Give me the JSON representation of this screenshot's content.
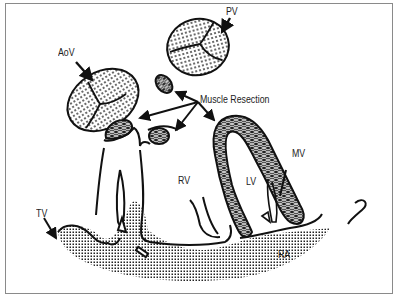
{
  "diagram": {
    "title": "",
    "labels": {
      "aov": "AoV",
      "pv": "PV",
      "muscle_resection": "Muscle Resection",
      "rv": "RV",
      "lv": "LV",
      "mv": "MV",
      "tv": "TV",
      "ra": "RA"
    },
    "colors": {
      "stroke": "#111111",
      "frame": "#8a8a8a",
      "background": "#ffffff",
      "text": "#222222"
    }
  }
}
